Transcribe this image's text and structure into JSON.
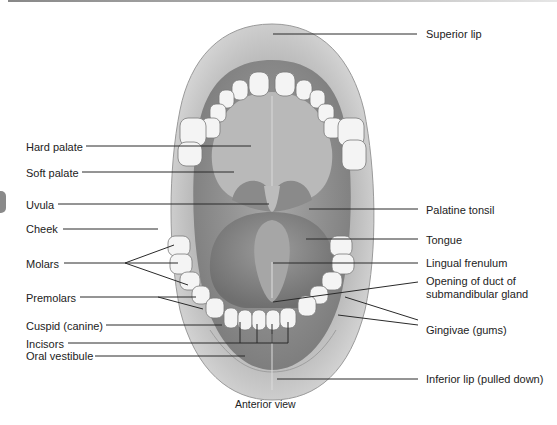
{
  "figure": {
    "view_caption": "Anterior view",
    "labels_left": {
      "hard_palate": "Hard palate",
      "soft_palate": "Soft palate",
      "uvula": "Uvula",
      "cheek": "Cheek",
      "molars": "Molars",
      "premolars": "Premolars",
      "cuspid": "Cuspid (canine)",
      "incisors": "Incisors",
      "oral_vestibule": "Oral vestibule"
    },
    "labels_right": {
      "superior_lip": "Superior lip",
      "palatine_tonsil": "Palatine tonsil",
      "tongue": "Tongue",
      "lingual_frenulum": "Lingual frenulum",
      "duct_opening_line1": "Opening of duct of",
      "duct_opening_line2": "submandibular gland",
      "gingivae": "Gingivae (gums)",
      "inferior_lip": "Inferior lip (pulled down)"
    },
    "colors": {
      "leader_line": "#2a2a2a",
      "tissue_dark": "#8d8d8d",
      "tissue_mid": "#b5b5b5",
      "tissue_light": "#d9d9d9",
      "tooth": "#f4f4f4"
    }
  }
}
